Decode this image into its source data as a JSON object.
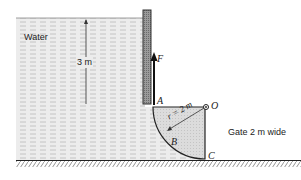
{
  "diagram": {
    "labels": {
      "water": "Water",
      "depth": "3 m",
      "force": "F",
      "point_a": "A",
      "point_o": "O",
      "point_b": "B",
      "point_c": "C",
      "radius": "r = 2 m",
      "gate_width": "Gate 2 m wide"
    },
    "colors": {
      "water_fill": "#e6e6e6",
      "water_dash": "#b8b8b8",
      "gate_fill": "#d6d6d6",
      "wall_fill": "#8a8a8a",
      "line": "#222222"
    }
  }
}
